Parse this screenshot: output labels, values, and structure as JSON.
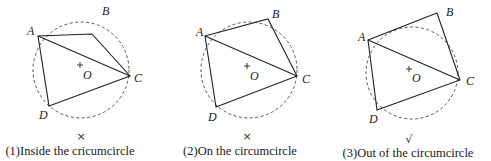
{
  "figure": {
    "panels": [
      {
        "id": 1,
        "caption": "(1)Inside the cricumcircle",
        "mark": "×",
        "labels": {
          "A": "A",
          "B": "B",
          "C": "C",
          "D": "D",
          "O": "O"
        }
      },
      {
        "id": 2,
        "caption": "(2)On the circumcircle",
        "mark": "×",
        "labels": {
          "A": "A",
          "B": "B",
          "C": "C",
          "D": "D",
          "O": "O"
        }
      },
      {
        "id": 3,
        "caption": "(3)Out of the circumcircle",
        "mark": "√",
        "labels": {
          "A": "A",
          "B": "B",
          "C": "C",
          "D": "D",
          "O": "O"
        }
      }
    ]
  }
}
